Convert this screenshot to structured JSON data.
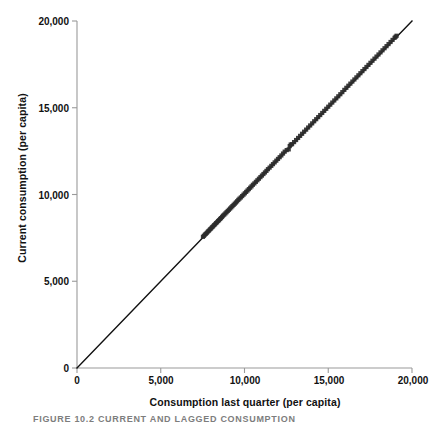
{
  "figure": {
    "caption": "FIGURE 10.2   CURRENT AND LAGGED CONSUMPTION",
    "background_color": "#ffffff",
    "axis_color": "#9a9a9a",
    "marker_color": "#2b2b2b",
    "line_color": "#111111"
  },
  "chart_data": {
    "type": "scatter",
    "title": "",
    "subtitle": "",
    "xlabel": "Consumption last quarter (per capita)",
    "ylabel": "Current consumption (per capita)",
    "xlim": [
      0,
      20000
    ],
    "ylim": [
      0,
      20000
    ],
    "xticks": [
      0,
      5000,
      10000,
      15000,
      20000
    ],
    "yticks": [
      0,
      5000,
      10000,
      15000,
      20000
    ],
    "xticklabels": [
      "0",
      "5,000",
      "10,000",
      "15,000",
      "20,000"
    ],
    "yticklabels": [
      "0",
      "5,000",
      "10,000",
      "15,000",
      "20,000"
    ],
    "grid": false,
    "legend": null,
    "legend_position": "none",
    "annotations": [],
    "reference_line": {
      "name": "45-degree line",
      "slope": 1,
      "intercept": 0,
      "x": [
        0,
        20000
      ],
      "y": [
        0,
        20000
      ],
      "color": "#111111"
    },
    "series": [
      {
        "name": "Consumption pairs",
        "marker": "filled-square",
        "color": "#2b2b2b",
        "x": [
          7520,
          7580,
          7640,
          7700,
          7760,
          7820,
          7880,
          7940,
          8000,
          8060,
          8120,
          8180,
          8240,
          8300,
          8360,
          8420,
          8480,
          8540,
          8600,
          8660,
          8720,
          8790,
          8860,
          8930,
          9000,
          9070,
          9140,
          9210,
          9280,
          9350,
          9420,
          9490,
          9560,
          9630,
          9700,
          9780,
          9860,
          9940,
          10020,
          10100,
          10180,
          10260,
          10340,
          10420,
          10500,
          10590,
          10680,
          10770,
          10860,
          10950,
          11040,
          11130,
          11220,
          11310,
          11400,
          11500,
          11600,
          11700,
          11800,
          11900,
          12000,
          12100,
          12200,
          12300,
          12400,
          12520,
          12640,
          12700,
          12760,
          12840,
          12960,
          13080,
          13200,
          13320,
          13440,
          13560,
          13680,
          13800,
          13920,
          14040,
          14160,
          14280,
          14400,
          14520,
          14640,
          14760,
          14880,
          15000,
          15120,
          15240,
          15360,
          15480,
          15600,
          15720,
          15840,
          15960,
          16080,
          16200,
          16320,
          16440,
          16560,
          16680,
          16800,
          16920,
          17040,
          17160,
          17280,
          17400,
          17520,
          17640,
          17760,
          17880,
          18000,
          18120,
          18240,
          18360,
          18480,
          18600,
          18720,
          18840,
          18960,
          19020,
          19080
        ],
        "y": [
          7560,
          7620,
          7690,
          7740,
          7800,
          7870,
          7920,
          7990,
          8040,
          8110,
          8160,
          8230,
          8280,
          8350,
          8400,
          8470,
          8520,
          8590,
          8640,
          8710,
          8780,
          8840,
          8910,
          8980,
          9050,
          9120,
          9190,
          9260,
          9330,
          9400,
          9470,
          9540,
          9610,
          9690,
          9760,
          9830,
          9910,
          9990,
          10070,
          10150,
          10230,
          10310,
          10390,
          10470,
          10560,
          10640,
          10730,
          10820,
          10910,
          11000,
          11090,
          11180,
          11270,
          11360,
          11460,
          11550,
          11650,
          11750,
          11850,
          11950,
          12050,
          12150,
          12250,
          12360,
          12470,
          12560,
          12600,
          12790,
          12880,
          12900,
          13020,
          13140,
          13260,
          13380,
          13500,
          13620,
          13740,
          13860,
          13980,
          14100,
          14220,
          14340,
          14460,
          14580,
          14700,
          14820,
          14940,
          15060,
          15180,
          15300,
          15420,
          15540,
          15660,
          15780,
          15900,
          16030,
          16150,
          16270,
          16390,
          16510,
          16630,
          16750,
          16870,
          16990,
          17110,
          17230,
          17350,
          17470,
          17590,
          17710,
          17830,
          17950,
          18070,
          18190,
          18310,
          18430,
          18550,
          18670,
          18790,
          18910,
          19030,
          19090,
          19150
        ]
      }
    ]
  }
}
